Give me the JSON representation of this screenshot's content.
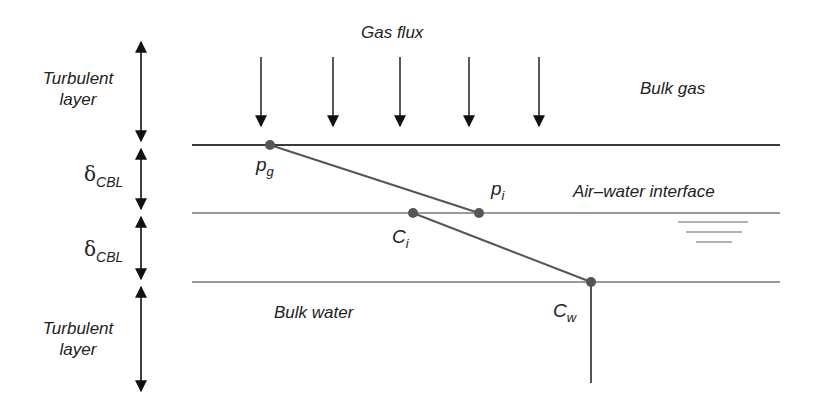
{
  "title": "Gas flux",
  "regions": {
    "bulk_gas": "Bulk gas",
    "interface": "Air–water interface",
    "bulk_water": "Bulk water"
  },
  "layers": [
    {
      "label_line1": "Turbulent",
      "label_line2": "layer"
    },
    {
      "symbol": "δ",
      "subscript": "CBL"
    },
    {
      "symbol": "δ",
      "subscript": "CBL"
    },
    {
      "label_line1": "Turbulent",
      "label_line2": "layer"
    }
  ],
  "points": {
    "pg": {
      "base": "p",
      "sub": "g"
    },
    "pi": {
      "base": "p",
      "sub": "i"
    },
    "ci": {
      "base": "C",
      "sub": "i"
    },
    "cw": {
      "base": "C",
      "sub": "w"
    }
  },
  "flux_arrow_count": 5,
  "colors": {
    "text": "#222222",
    "gas_line": "#3a3a3a",
    "water_lines": "#9a9a9a",
    "profile": "#555555",
    "points": "#555555"
  }
}
